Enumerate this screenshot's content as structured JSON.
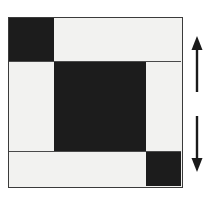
{
  "figure": {
    "grid": {
      "rows": 3,
      "columns": 3,
      "cells": [
        {
          "id": "r1c1",
          "row": 1,
          "col": 1,
          "fill": "dark",
          "label": "top-left-dark-square"
        },
        {
          "id": "r1c2",
          "row": 1,
          "col": 2,
          "fill": "light",
          "label": "top-right-light-bar"
        },
        {
          "id": "r2c1",
          "row": 2,
          "col": 1,
          "fill": "light",
          "label": "middle-left-light-bar"
        },
        {
          "id": "r2c2",
          "row": 2,
          "col": 2,
          "fill": "dark",
          "label": "center-dark-square"
        },
        {
          "id": "r2c3",
          "row": 2,
          "col": 3,
          "fill": "light",
          "label": "middle-right-light-bar"
        },
        {
          "id": "r3c1",
          "row": 3,
          "col": 1,
          "fill": "light",
          "label": "bottom-left-light-bar"
        },
        {
          "id": "r3c2",
          "row": 3,
          "col": 3,
          "fill": "dark",
          "label": "bottom-right-dark-square"
        }
      ]
    },
    "colors": {
      "dark": "#1c1c1c",
      "light": "#f2f2f0",
      "border": "#3b3b3b",
      "arrow": "#1a1a1a",
      "background": "#ffffff"
    }
  },
  "annotations": {
    "arrows": [
      {
        "name": "up-arrow",
        "direction": "up",
        "label": ""
      },
      {
        "name": "down-arrow",
        "direction": "down",
        "label": ""
      }
    ]
  }
}
